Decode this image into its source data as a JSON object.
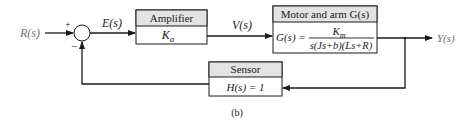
{
  "diagram": {
    "type": "block-diagram",
    "caption": "(b)",
    "colors": {
      "line": "#1a1a1a",
      "header_fill": "#e3e3e3",
      "body_fill": "#ffffff",
      "io_text": "#707070"
    },
    "input": {
      "label": "R(s)"
    },
    "output": {
      "label": "Y(s)"
    },
    "summing_junction": {
      "plus_sign": "+",
      "minus_sign": "−"
    },
    "signals": {
      "error": "E(s)",
      "voltage": "V(s)"
    },
    "blocks": {
      "amplifier": {
        "title": "Amplifier",
        "gain_symbol": "K",
        "gain_subscript": "a"
      },
      "motor": {
        "title": "Motor and arm G(s)",
        "lhs": "G(s) =",
        "numerator_symbol": "K",
        "numerator_subscript": "m",
        "denominator": "s(Js+b)(Ls+R)"
      },
      "sensor": {
        "title": "Sensor",
        "expression": "H(s) = 1"
      }
    }
  }
}
